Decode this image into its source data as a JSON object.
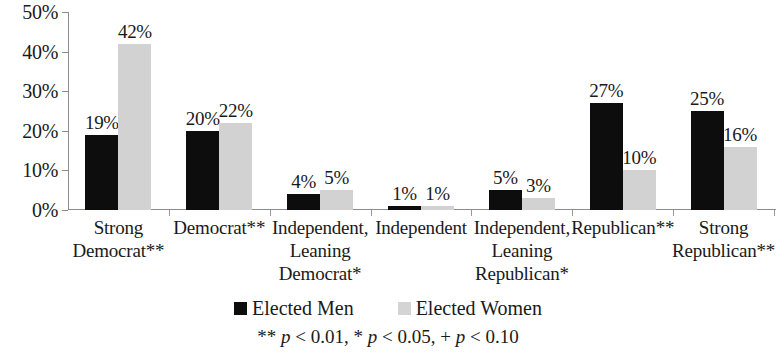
{
  "chart_data": {
    "type": "bar",
    "title": "",
    "xlabel": "",
    "ylabel": "",
    "ylim": [
      0,
      50
    ],
    "grid": false,
    "legend_position": "bottom",
    "y_ticks": [
      "0%",
      "10%",
      "20%",
      "30%",
      "40%",
      "50%"
    ],
    "y_tick_values": [
      0,
      10,
      20,
      30,
      40,
      50
    ],
    "categories": [
      "Strong\nDemocrat**",
      "Democrat**",
      "Independent,\nLeaning\nDemocrat*",
      "Independent",
      "Independent,\nLeaning\nRepublican*",
      "Republican**",
      "Strong\nRepublican**"
    ],
    "series": [
      {
        "name": "Elected Men",
        "color": "#0d0d0d",
        "values": [
          19,
          20,
          4,
          1,
          5,
          27,
          25
        ],
        "labels": [
          "19%",
          "20%",
          "4%",
          "1%",
          "5%",
          "27%",
          "25%"
        ]
      },
      {
        "name": "Elected Women",
        "color": "#d2d2d2",
        "values": [
          42,
          22,
          5,
          1,
          3,
          10,
          16
        ],
        "labels": [
          "42%",
          "22%",
          "5%",
          "1%",
          "3%",
          "10%",
          "16%"
        ]
      }
    ],
    "footnote": "** p < 0.01, * p < 0.05, + p < 0.10",
    "footnote_parts": {
      "a": "** ",
      "p1": "p",
      "b": " < 0.01, * ",
      "p2": "p",
      "c": " < 0.05, + ",
      "p3": "p",
      "d": " < 0.10"
    }
  }
}
